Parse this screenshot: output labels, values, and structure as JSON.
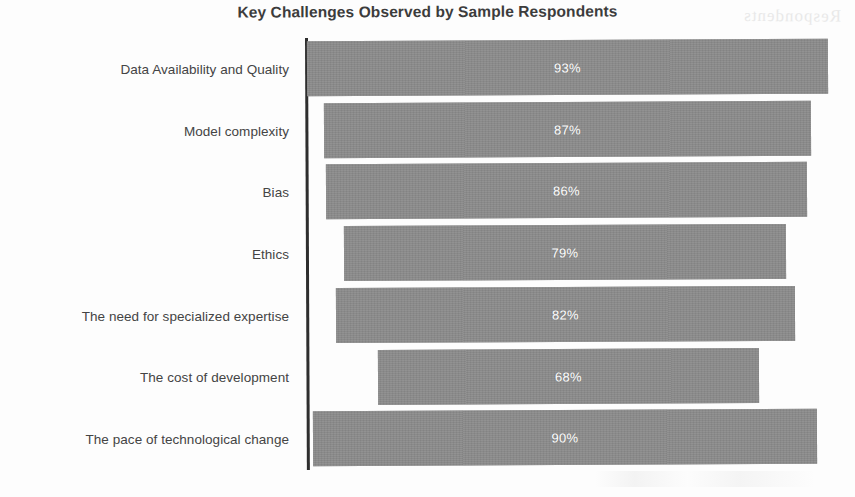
{
  "chart_data": {
    "type": "bar",
    "orientation": "horizontal",
    "title": "Key Challenges Observed by Sample Respondents",
    "xlabel": "",
    "ylabel": "",
    "xlim": [
      0,
      100
    ],
    "grid": false,
    "legend": false,
    "value_suffix": "%",
    "categories": [
      "Data Availability and Quality",
      "Model complexity",
      "Bias",
      "Ethics",
      "The need for specialized expertise",
      "The cost of development",
      "The pace of technological change"
    ],
    "values": [
      93,
      87,
      86,
      79,
      82,
      68,
      90
    ],
    "data_labels": [
      "93%",
      "87%",
      "86%",
      "79%",
      "82%",
      "68%",
      "90%"
    ],
    "series": [
      {
        "name": "Respondents",
        "values": [
          93,
          87,
          86,
          79,
          82,
          68,
          90
        ]
      }
    ],
    "bar_color": "#8a8a8a",
    "label_color": "#ffffff",
    "axis_color": "#2e2e2e",
    "title_color": "#3c3c3c",
    "background": "#fdfdfd"
  },
  "bars": [
    {
      "category": "Data Availability and Quality",
      "value": 93,
      "label": "93%",
      "left_px": 307,
      "width_px": 521
    },
    {
      "category": "Model complexity",
      "value": 87,
      "label": "87%",
      "left_px": 324,
      "width_px": 487
    },
    {
      "category": "Bias",
      "value": 86,
      "label": "86%",
      "left_px": 326,
      "width_px": 481
    },
    {
      "category": "Ethics",
      "value": 79,
      "label": "79%",
      "left_px": 344,
      "width_px": 442
    },
    {
      "category": "The need for specialized expertise",
      "value": 82,
      "label": "82%",
      "left_px": 336,
      "width_px": 459
    },
    {
      "category": "The cost of development",
      "value": 68,
      "label": "68%",
      "left_px": 378,
      "width_px": 381
    },
    {
      "category": "The pace of technological change",
      "value": 90,
      "label": "90%",
      "left_px": 313,
      "width_px": 504
    }
  ],
  "artifacts": {
    "scan_ghost_text": "Respondents"
  }
}
